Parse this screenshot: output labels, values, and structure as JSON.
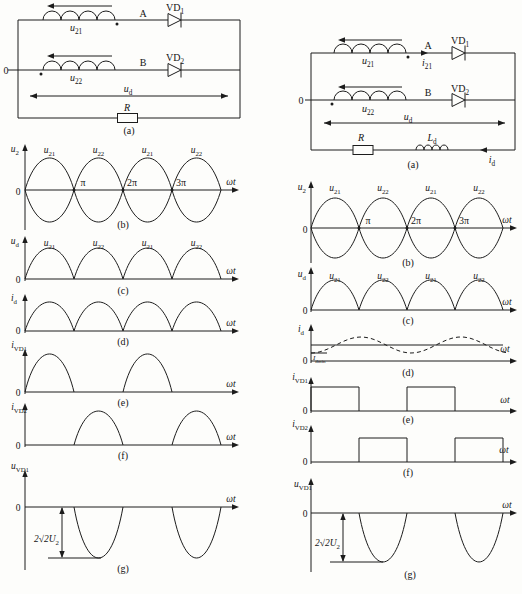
{
  "figure": {
    "columns": [
      {
        "id": "left",
        "circuit": {
          "caption": "(a)",
          "center_tap_label": "0",
          "top_winding_label": "u|21",
          "bottom_winding_label": "u|22",
          "node_a_label": "A",
          "node_b_label": "B",
          "diode1_label": "VD|1",
          "diode2_label": "VD|2",
          "output_voltage_label": "u|d",
          "resistor_label": "R"
        },
        "panels": [
          {
            "id": "b",
            "y_label": "u|2",
            "zero": "0",
            "x_label": "ωt",
            "ticks": [
              "π",
              "2π",
              "3π"
            ],
            "hump_labels": [
              "u|21",
              "u|22",
              "u|21",
              "u|22"
            ],
            "caption": "(b)"
          },
          {
            "id": "c",
            "y_label": "u|d",
            "zero": "0",
            "x_label": "ωt",
            "hump_labels": [
              "u|21",
              "u|22",
              "u|21",
              "u|22"
            ],
            "caption": "(c)"
          },
          {
            "id": "d",
            "y_label": "i|d",
            "zero": "0",
            "x_label": "ωt",
            "caption": "(d)"
          },
          {
            "id": "e",
            "y_label": "i|VD1",
            "zero": "0",
            "x_label": "ωt",
            "caption": "(e)"
          },
          {
            "id": "f",
            "y_label": "i|VD2",
            "zero": "0",
            "x_label": "ωt",
            "caption": "(f)"
          },
          {
            "id": "g",
            "y_label": "u|VD1",
            "zero": "0",
            "x_label": "ωt",
            "peak_annotation": "2√2U|2",
            "caption": "(g)"
          }
        ]
      },
      {
        "id": "right",
        "circuit": {
          "caption": "(a)",
          "center_tap_label": "0",
          "top_winding_label": "u|21",
          "bottom_winding_label": "u|22",
          "secondary_current_label": "i|21",
          "node_a_label": "A",
          "node_b_label": "B",
          "diode1_label": "VD|1",
          "diode2_label": "VD|2",
          "output_voltage_label": "u|d",
          "resistor_label": "R",
          "inductor_label": "L|d",
          "load_current_label": "i|d"
        },
        "panels": [
          {
            "id": "b",
            "y_label": "u|2",
            "zero": "0",
            "x_label": "ωt",
            "ticks": [
              "π",
              "2π",
              "3π"
            ],
            "hump_labels": [
              "u|21",
              "u|22",
              "u|21",
              "u|22"
            ],
            "caption": "(b)"
          },
          {
            "id": "c",
            "y_label": "u|d",
            "zero": "0",
            "x_label": "ωt",
            "hump_labels": [
              "u|21",
              "u|22",
              "u|21",
              "u|22"
            ],
            "caption": "(c)"
          },
          {
            "id": "d",
            "y_label": "i|d",
            "zero": "0",
            "x_label": "ωt",
            "min_annotation": "I|dmin",
            "caption": "(d)"
          },
          {
            "id": "e",
            "y_label": "i|VD1",
            "zero": "0",
            "x_label": "ωt",
            "caption": "(e)"
          },
          {
            "id": "f",
            "y_label": "i|VD2",
            "zero": "0",
            "x_label": "ωt",
            "caption": "(f)"
          },
          {
            "id": "g",
            "y_label": "u|VD1",
            "zero": "0",
            "x_label": "ωt",
            "peak_annotation": "2√2U|2",
            "caption": "(g)"
          }
        ]
      }
    ]
  }
}
